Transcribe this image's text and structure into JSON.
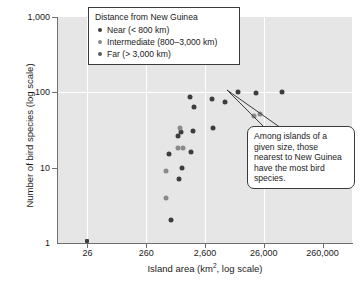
{
  "chart_data": {
    "type": "scatter",
    "title": "",
    "xlabel": "Island area (km2, log scale)",
    "xlabel_base": "Island area (km",
    "xlabel_sup": "2",
    "xlabel_tail": ", log scale)",
    "ylabel": "Number of bird species (log scale)",
    "xscale": "log",
    "yscale": "log",
    "xlim": [
      8.22,
      822000
    ],
    "ylim": [
      1,
      1000
    ],
    "xticks": [
      26,
      260,
      2600,
      26000,
      260000
    ],
    "xticklabels": [
      "26",
      "260",
      "2,600",
      "26,000",
      "260,000"
    ],
    "yticks": [
      1,
      10,
      100,
      1000
    ],
    "yticklabels": [
      "1",
      "10",
      "100",
      "1,000"
    ],
    "grid": "white gridlines at x ticks 26/260/2600/26000 and y tick 100",
    "legend_position": "top-center inside plot",
    "plot_background": "#e6e6e6",
    "series": [
      {
        "name": "Near (< 800 km)",
        "color": "#3d3d3d",
        "points": [
          {
            "x": 26,
            "y": 1.05
          },
          {
            "x": 1450,
            "y": 88
          },
          {
            "x": 1700,
            "y": 63
          },
          {
            "x": 3400,
            "y": 82
          },
          {
            "x": 5800,
            "y": 75
          },
          {
            "x": 3600,
            "y": 34
          },
          {
            "x": 9500,
            "y": 100
          },
          {
            "x": 19000,
            "y": 99
          },
          {
            "x": 52000,
            "y": 102
          },
          {
            "x": 1600,
            "y": 31
          },
          {
            "x": 1000,
            "y": 30
          },
          {
            "x": 1500,
            "y": 16
          },
          {
            "x": 900,
            "y": 26
          },
          {
            "x": 640,
            "y": 15
          },
          {
            "x": 1050,
            "y": 10
          },
          {
            "x": 930,
            "y": 7
          },
          {
            "x": 700,
            "y": 2
          },
          {
            "x": 22000,
            "y": 30
          }
        ]
      },
      {
        "name": "Intermediate (800–3,000 km)",
        "color": "#8a8a8a",
        "points": [
          {
            "x": 560,
            "y": 9
          },
          {
            "x": 560,
            "y": 4
          },
          {
            "x": 960,
            "y": 34
          },
          {
            "x": 900,
            "y": 18
          },
          {
            "x": 1100,
            "y": 18.5
          },
          {
            "x": 18000,
            "y": 48
          },
          {
            "x": 22000,
            "y": 51
          }
        ]
      },
      {
        "name": "Far (> 3,000 km)",
        "color": "#6a6a6a",
        "points": []
      }
    ]
  },
  "legend": {
    "title": "Distance from New Guinea",
    "items": [
      {
        "label": "Near (< 800 km)",
        "color": "#3d3d3d"
      },
      {
        "label": "Intermediate (800–3,000 km)",
        "color": "#8a8a8a"
      },
      {
        "label": "Far (> 3,000 km)",
        "color": "#5a5a5a"
      }
    ]
  },
  "callout": {
    "text": "Among islands of a given size, those nearest to New Guinea have the most bird species."
  }
}
